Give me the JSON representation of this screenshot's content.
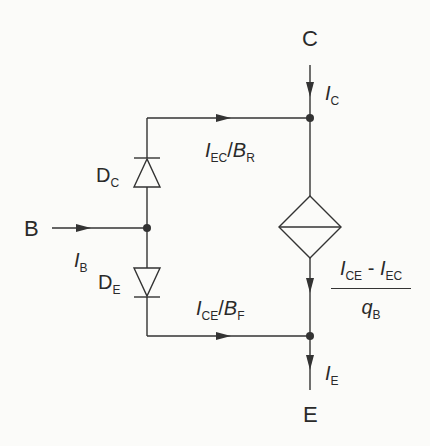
{
  "diagram": {
    "type": "circuit-schematic",
    "colors": {
      "wire": "#333333",
      "text": "#2a2a2a",
      "background": "#fbfbf9"
    },
    "terminals": {
      "collector": "C",
      "base": "B",
      "emitter": "E"
    },
    "currents": {
      "collector": {
        "symbol": "I",
        "sub": "C"
      },
      "base": {
        "symbol": "I",
        "sub": "B"
      },
      "emitter": {
        "symbol": "I",
        "sub": "E"
      }
    },
    "diodes": {
      "collector_diode": {
        "symbol": "D",
        "sub": "C"
      },
      "emitter_diode": {
        "symbol": "D",
        "sub": "E"
      }
    },
    "branch_currents": {
      "top": {
        "num_sym": "I",
        "num_sub": "EC",
        "slash": "/",
        "den_sym": "B",
        "den_sub": "R"
      },
      "bottom": {
        "num_sym": "I",
        "num_sub": "CE",
        "slash": "/",
        "den_sym": "B",
        "den_sub": "F"
      }
    },
    "source_current": {
      "numerator": {
        "a_sym": "I",
        "a_sub": "CE",
        "op": " - ",
        "b_sym": "I",
        "b_sub": "EC"
      },
      "denominator": {
        "sym": "q",
        "sub": "B"
      }
    }
  }
}
